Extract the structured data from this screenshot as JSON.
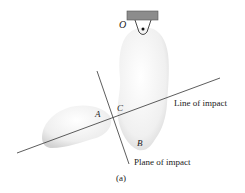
{
  "figure": {
    "caption": "(a)",
    "points": {
      "pivot": "O",
      "body_a": "A",
      "body_b": "B",
      "contact": "C"
    },
    "lines": {
      "line_of_impact": "Line of impact",
      "plane_of_impact": "Plane of impact"
    },
    "colors": {
      "support_block": "#8c8c8c",
      "body_fill": "#f2f2f2",
      "body_shade": "#d8d8d8",
      "line": "#333333"
    }
  }
}
